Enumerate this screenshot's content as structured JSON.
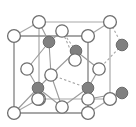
{
  "figure": {
    "type": "crystal-structure-diagram",
    "background_color": "#ffffff",
    "canvas": {
      "width": 136,
      "height": 127
    }
  },
  "style": {
    "open_atom_fill": "#ffffff",
    "open_atom_stroke": "#6e6e6e",
    "filled_atom_fill": "#808080",
    "filled_atom_stroke": "#6a6a6a",
    "cell_edge_color": "#8a8a8a",
    "cell_edge_back_color": "#a8a8a8",
    "bond_color": "#9a9a9a",
    "atom_radius_open": 6.2,
    "atom_radius_filled": 5.6,
    "atom_radius_open_small": 5.4
  },
  "cell": {
    "front_face": [
      {
        "name": "front-top-left",
        "x": 14,
        "y": 36
      },
      {
        "name": "front-top-right",
        "x": 88,
        "y": 36
      },
      {
        "name": "front-bottom-right",
        "x": 88,
        "y": 113
      },
      {
        "name": "front-bottom-left",
        "x": 14,
        "y": 113
      }
    ],
    "back_face": [
      {
        "name": "back-top-left",
        "x": 39,
        "y": 22
      },
      {
        "name": "back-top-right",
        "x": 110,
        "y": 22
      },
      {
        "name": "back-bottom-right",
        "x": 110,
        "y": 99
      },
      {
        "name": "back-bottom-left",
        "x": 39,
        "y": 99
      }
    ],
    "connectors": [
      {
        "from": "front-top-left",
        "to": "back-top-left"
      },
      {
        "from": "front-top-right",
        "to": "back-top-right"
      },
      {
        "from": "front-bottom-right",
        "to": "back-bottom-right"
      },
      {
        "from": "front-bottom-left",
        "to": "back-bottom-left"
      }
    ]
  },
  "atoms_open": [
    {
      "id": "corner-ftl",
      "label": "front-top-left-corner",
      "x": 14,
      "y": 36,
      "r": 6.4
    },
    {
      "id": "corner-ftr",
      "label": "front-top-right-corner",
      "x": 88,
      "y": 36,
      "r": 6.4
    },
    {
      "id": "corner-fbl",
      "label": "front-bottom-left-corner",
      "x": 14,
      "y": 113,
      "r": 6.4
    },
    {
      "id": "corner-fbr",
      "label": "front-bottom-right-corner",
      "x": 88,
      "y": 113,
      "r": 6.4
    },
    {
      "id": "corner-btl",
      "label": "back-top-left-corner",
      "x": 39,
      "y": 22,
      "r": 6.4
    },
    {
      "id": "corner-btr",
      "label": "back-top-right-corner",
      "x": 110,
      "y": 22,
      "r": 6.4
    },
    {
      "id": "corner-bbl",
      "label": "back-bottom-left-corner",
      "x": 39,
      "y": 99,
      "r": 6.4
    },
    {
      "id": "corner-bbr",
      "label": "back-bottom-right-corner",
      "x": 110,
      "y": 99,
      "r": 6.4
    },
    {
      "id": "face-top",
      "label": "top-face-center",
      "x": 62,
      "y": 31,
      "r": 6.2
    },
    {
      "id": "face-bottom",
      "label": "bottom-face-center",
      "x": 62,
      "y": 107,
      "r": 6.2
    },
    {
      "id": "face-left",
      "label": "left-face-center",
      "x": 27,
      "y": 69,
      "r": 6.2
    },
    {
      "id": "face-right",
      "label": "right-face-center",
      "x": 99,
      "y": 69,
      "r": 6.2
    },
    {
      "id": "face-front",
      "label": "front-face-center",
      "x": 51,
      "y": 75,
      "r": 6.2
    },
    {
      "id": "face-back",
      "label": "back-face-center",
      "x": 75,
      "y": 60,
      "r": 6.2
    },
    {
      "id": "edge-left-low",
      "label": "lower-left-edge-atom",
      "x": 38,
      "y": 99,
      "r": 6.2
    },
    {
      "id": "edge-right-low",
      "label": "lower-right-edge-atom",
      "x": 88,
      "y": 99,
      "r": 6.2
    }
  ],
  "atoms_filled": [
    {
      "id": "tetra-upper-left",
      "label": "upper-left-tetrahedral-atom",
      "x": 49,
      "y": 42,
      "r": 5.8
    },
    {
      "id": "tetra-upper-right",
      "label": "upper-right-tetrahedral-atom",
      "x": 76,
      "y": 51,
      "r": 5.8
    },
    {
      "id": "tetra-lower-left",
      "label": "lower-left-tetrahedral-atom",
      "x": 38,
      "y": 88,
      "r": 5.8
    },
    {
      "id": "tetra-lower-right",
      "label": "lower-right-tetrahedral-atom",
      "x": 88,
      "y": 88,
      "r": 5.8
    },
    {
      "id": "outside-upper-right",
      "label": "outside-upper-right-atom",
      "x": 122,
      "y": 45,
      "r": 5.8
    },
    {
      "id": "outside-lower-right",
      "label": "outside-lower-right-atom",
      "x": 122,
      "y": 93,
      "r": 5.8
    }
  ],
  "bonds": [
    {
      "from": "tetra-upper-left",
      "to": "corner-btl",
      "style": "solid"
    },
    {
      "from": "tetra-upper-left",
      "to": "face-top",
      "style": "solid"
    },
    {
      "from": "tetra-upper-left",
      "to": "face-left",
      "style": "solid"
    },
    {
      "from": "tetra-upper-left",
      "to": "face-front",
      "style": "solid"
    },
    {
      "from": "tetra-upper-right",
      "to": "face-top",
      "style": "dashed"
    },
    {
      "from": "tetra-upper-right",
      "to": "face-back",
      "style": "solid"
    },
    {
      "from": "tetra-upper-right",
      "to": "face-right",
      "style": "solid"
    },
    {
      "from": "tetra-upper-right",
      "to": "face-front",
      "style": "solid"
    },
    {
      "from": "tetra-lower-left",
      "to": "face-left",
      "style": "solid"
    },
    {
      "from": "tetra-lower-left",
      "to": "face-front",
      "style": "solid"
    },
    {
      "from": "tetra-lower-left",
      "to": "edge-left-low",
      "style": "solid"
    },
    {
      "from": "tetra-lower-left",
      "to": "corner-fbl",
      "style": "solid"
    },
    {
      "from": "tetra-lower-left",
      "to": "face-bottom",
      "style": "solid"
    },
    {
      "from": "tetra-lower-right",
      "to": "face-right",
      "style": "solid"
    },
    {
      "from": "tetra-lower-right",
      "to": "face-front",
      "style": "dashed"
    },
    {
      "from": "tetra-lower-right",
      "to": "edge-right-low",
      "style": "solid"
    },
    {
      "from": "tetra-lower-right",
      "to": "face-bottom",
      "style": "solid"
    },
    {
      "from": "tetra-lower-right",
      "to": "corner-fbr",
      "style": "solid"
    },
    {
      "from": "outside-upper-right",
      "to": "corner-btr",
      "style": "dashed"
    },
    {
      "from": "outside-upper-right",
      "to": "face-right",
      "style": "dashed"
    },
    {
      "from": "outside-lower-right",
      "to": "corner-bbr",
      "style": "dashed"
    },
    {
      "from": "outside-lower-right",
      "to": "edge-right-low",
      "style": "solid"
    },
    {
      "from": "face-back",
      "to": "face-top",
      "style": "dashed"
    },
    {
      "from": "face-front",
      "to": "face-bottom",
      "style": "solid"
    }
  ]
}
